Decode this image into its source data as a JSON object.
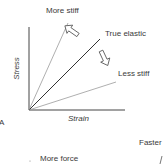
{
  "panel_label": "A",
  "axes": {
    "y_label": "Stress",
    "x_label": "Strain"
  },
  "lines": [
    {
      "name": "More stiff",
      "label": "More stiff",
      "color": "#8a8a8a"
    },
    {
      "name": "True elastic",
      "label": "True elastic",
      "color": "#333333"
    },
    {
      "name": "Less stiff",
      "label": "Less stiff",
      "color": "#8a8a8a"
    }
  ],
  "arrows": [
    {
      "icon": "hollow-arrow-up-left-icon",
      "meaning": "toward more stiff"
    },
    {
      "icon": "hollow-arrow-down-right-icon",
      "meaning": "toward less stiff"
    }
  ],
  "bottom_labels": {
    "faster": "Faster",
    "more_force": "More force"
  }
}
